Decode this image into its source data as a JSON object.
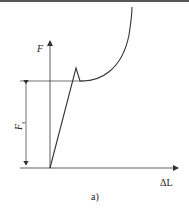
{
  "diagram": {
    "y_axis_label": "F",
    "x_axis_label": "ΔL",
    "dimension_label": "F",
    "dimension_subscript": "s",
    "caption": "a)",
    "line_color": "#333333"
  }
}
